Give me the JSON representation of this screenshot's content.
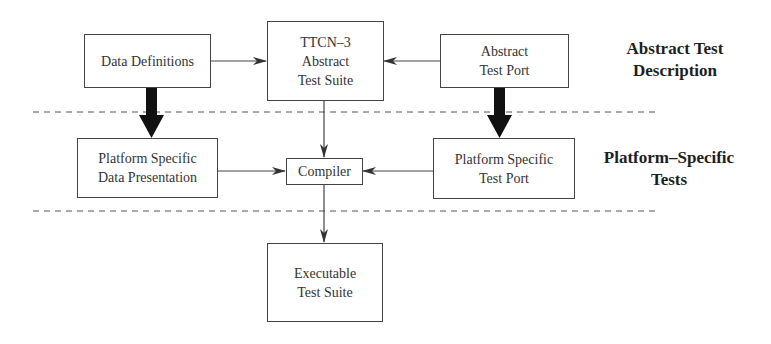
{
  "diagram": {
    "nodes": {
      "data_definitions": {
        "lines": [
          "Data Definitions"
        ]
      },
      "ttcn3_suite": {
        "lines": [
          "TTCN–3",
          "Abstract",
          "Test Suite"
        ]
      },
      "abstract_test_port": {
        "lines": [
          "Abstract",
          "Test Port"
        ]
      },
      "ps_data_presentation": {
        "lines": [
          "Platform Specific",
          "Data Presentation"
        ]
      },
      "compiler": {
        "lines": [
          "Compiler"
        ]
      },
      "ps_test_port": {
        "lines": [
          "Platform Specific",
          "Test Port"
        ]
      },
      "executable_suite": {
        "lines": [
          "Executable",
          "Test Suite"
        ]
      }
    },
    "layers": {
      "abstract": {
        "lines": [
          "Abstract Test",
          "Description"
        ]
      },
      "platform": {
        "lines": [
          "Platform–Specific",
          "Tests"
        ]
      }
    },
    "edges": [
      {
        "from": "Data Definitions",
        "to": "TTCN-3 Abstract Test Suite",
        "style": "thin"
      },
      {
        "from": "Abstract Test Port",
        "to": "TTCN-3 Abstract Test Suite",
        "style": "thin"
      },
      {
        "from": "TTCN-3 Abstract Test Suite",
        "to": "Compiler",
        "style": "thin"
      },
      {
        "from": "Platform Specific Data Presentation",
        "to": "Compiler",
        "style": "thin"
      },
      {
        "from": "Platform Specific Test Port",
        "to": "Compiler",
        "style": "thin"
      },
      {
        "from": "Compiler",
        "to": "Executable Test Suite",
        "style": "thin"
      },
      {
        "from": "Data Definitions",
        "to": "Platform Specific Data Presentation",
        "style": "thick"
      },
      {
        "from": "Abstract Test Port",
        "to": "Platform Specific Test Port",
        "style": "thick"
      }
    ],
    "colors": {
      "line": "#444444",
      "text": "#333333",
      "thick_arrow": "#111111"
    }
  }
}
